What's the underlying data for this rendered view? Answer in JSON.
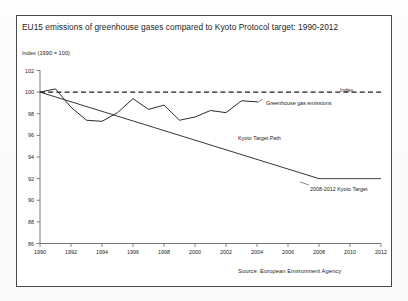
{
  "figure": {
    "title": "EU15 emissions of greenhouse gases compared to Kyoto Protocol target: 1990-2012",
    "y_axis_title": "Index (1990 = 100)",
    "source": "Source: European Environment Agency"
  },
  "annotations": {
    "index": "Index",
    "emissions": "Greenhouse gas emissions",
    "kyoto_path": "Kyoto Target Path",
    "kyoto_target": "2008-2012 Kyoto Target"
  },
  "colors": {
    "frame": "#4a4a4a",
    "text": "#1d1d1d",
    "line": "#2c2c2c",
    "axis": "#555555",
    "background": "#ffffff"
  },
  "chart_data": {
    "type": "line",
    "title": "EU15 emissions of greenhouse gases compared to Kyoto Protocol target: 1990-2012",
    "xlabel": "",
    "ylabel": "Index (1990 = 100)",
    "xlim": [
      1990,
      2012
    ],
    "ylim": [
      86,
      102
    ],
    "xticks": [
      1990,
      1992,
      1994,
      1996,
      1998,
      2000,
      2002,
      2004,
      2006,
      2008,
      2010,
      2012
    ],
    "yticks": [
      86,
      88,
      90,
      92,
      94,
      96,
      98,
      100,
      102
    ],
    "grid": false,
    "legend": "inline-annotations",
    "series": [
      {
        "name": "Greenhouse gas emissions",
        "x": [
          1990,
          1991,
          1992,
          1993,
          1994,
          1995,
          1996,
          1997,
          1998,
          1999,
          2000,
          2001,
          2002,
          2003,
          2004
        ],
        "values": [
          100.0,
          100.3,
          98.6,
          97.4,
          97.3,
          98.1,
          99.4,
          98.4,
          98.8,
          97.4,
          97.7,
          98.3,
          98.1,
          99.2,
          99.1
        ]
      },
      {
        "name": "Index",
        "x": [
          1990,
          2012
        ],
        "values": [
          100,
          100
        ]
      },
      {
        "name": "Kyoto Target Path",
        "x": [
          1990,
          2008
        ],
        "values": [
          100.0,
          92.0
        ]
      },
      {
        "name": "2008-2012 Kyoto Target",
        "x": [
          2008,
          2012
        ],
        "values": [
          92.0,
          92.0
        ]
      }
    ]
  }
}
